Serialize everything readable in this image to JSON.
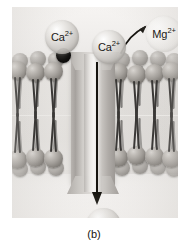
{
  "figure": {
    "caption": "(b)",
    "colors": {
      "background": "#f2f0ee",
      "lipid_head": "#85817c",
      "lipid_tail": "#3a3836",
      "channel_protein": "#c9c6c2",
      "arrow": "#16140f",
      "blocker": "#000000",
      "ion_calcium": "#cecbc7",
      "ion_magnesium": "#f2f0ee"
    }
  },
  "ions": [
    {
      "id": "ca-left",
      "species": "Ca",
      "charge": "2+",
      "label": "Ca",
      "sup": "2+",
      "location": "extracellular-left"
    },
    {
      "id": "ca-pore",
      "species": "Ca",
      "charge": "2+",
      "label": "Ca",
      "sup": "2+",
      "location": "channel-mouth"
    },
    {
      "id": "mg",
      "species": "Mg",
      "charge": "2+",
      "label": "Mg",
      "sup": "2+",
      "location": "extracellular-right-displaced"
    },
    {
      "id": "ca-bottom",
      "species": "Ca",
      "charge": "2+",
      "label": "Ca",
      "sup": "2+",
      "location": "cytosolic"
    }
  ],
  "annotations": {
    "flow_arrow_name": "calcium-influx-arrow",
    "curve_arrow_name": "magnesium-efflux-arrow",
    "blocker_name": "channel-blocker-particle"
  },
  "structure": {
    "membrane_label": "lipid bilayer",
    "channel_label": "ion channel protein",
    "upper_leaflet_lipids": 8,
    "lower_leaflet_lipids": 8
  }
}
